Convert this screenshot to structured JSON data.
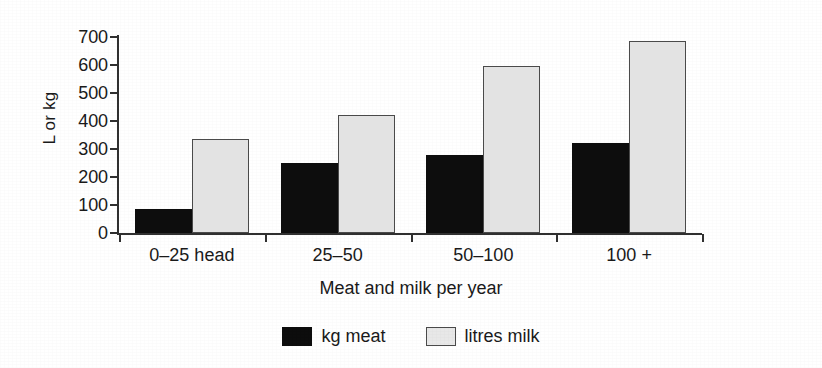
{
  "chart_data": {
    "type": "bar",
    "title": "",
    "subtitle": "",
    "xlabel": "Meat and milk per year",
    "ylabel": "L or kg",
    "categories": [
      "0–25 head",
      "25–50",
      "50–100",
      "100 +"
    ],
    "series": [
      {
        "name": "kg meat",
        "color": "#0d0d0d",
        "values": [
          85,
          250,
          280,
          320
        ]
      },
      {
        "name": "litres milk",
        "color": "#e3e3e3",
        "values": [
          335,
          420,
          595,
          685
        ]
      }
    ],
    "ylim": [
      0,
      700
    ],
    "ytick_values": [
      700,
      600,
      500,
      400,
      300,
      200,
      100,
      0
    ],
    "ytick_labels": [
      "700",
      "600",
      "500",
      "400",
      "300",
      "200",
      "100",
      "0"
    ],
    "grid": false,
    "legend_position": "bottom-center",
    "axis_color": "#303030"
  },
  "legend": {
    "items": [
      {
        "label": "kg meat",
        "swatch": "filled-black-square-icon"
      },
      {
        "label": "litres milk",
        "swatch": "outlined-grey-square-icon"
      }
    ]
  }
}
